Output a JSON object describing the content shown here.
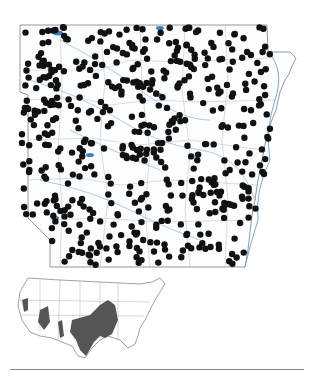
{
  "map": {
    "region": "Arkansas",
    "type": "species distribution dot map",
    "colors": {
      "dot": "#111111",
      "county_lines": "#9aa0a6",
      "rivers": "#8fb6d8",
      "lakes": "#3d7fc1",
      "state_outline": "#7a7f85"
    },
    "dot_radius": 3.2
  },
  "inset": {
    "region": "Contiguous United States",
    "colors": {
      "range_fill": "#555555",
      "state_lines": "#777777"
    }
  }
}
